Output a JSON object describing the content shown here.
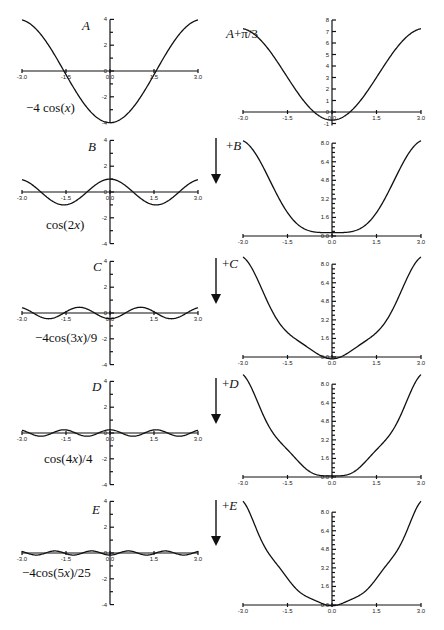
{
  "figure": {
    "colors": {
      "ink": "#111111",
      "background": "#ffffff"
    }
  },
  "chart_data": [
    {
      "type": "line",
      "id": "left-A",
      "panel_label": "A",
      "function_label": "−4 cos(x)",
      "x_ticks": [
        "-3.0",
        "-1.5",
        "0.0",
        "1.5",
        "3.0"
      ],
      "y_ticks": [
        "4",
        "2",
        "0",
        "-2",
        "-4"
      ],
      "xlim": [
        -3,
        3
      ],
      "ylim": [
        -4,
        4
      ],
      "series": [
        {
          "name": "-4cos(x)",
          "expr": "-4*cos(x)",
          "x": [
            -3,
            -2.25,
            -1.5,
            -0.75,
            0,
            0.75,
            1.5,
            2.25,
            3
          ],
          "y": [
            3.96,
            2.51,
            -0.28,
            -2.93,
            -4.0,
            -2.93,
            -0.28,
            2.51,
            3.96
          ]
        }
      ]
    },
    {
      "type": "line",
      "id": "right-A",
      "panel_label": "A+π²/3",
      "panel_label_display": "A+π/3",
      "x_ticks": [
        "-3.0",
        "-1.5",
        "0.0",
        "1.5",
        "3.0"
      ],
      "y_ticks": [
        "8",
        "7",
        "6",
        "5",
        "4",
        "3",
        "2",
        "1",
        "0",
        "-1"
      ],
      "xlim": [
        -3,
        3
      ],
      "ylim": [
        -1,
        8
      ],
      "series": [
        {
          "name": "A + pi^2/3",
          "expr": "pi*pi/3 - 4*cos(x)",
          "x": [
            -3,
            -1.5,
            0,
            1.5,
            3
          ],
          "y": [
            7.25,
            3.01,
            -0.71,
            3.01,
            7.25
          ]
        }
      ]
    },
    {
      "type": "line",
      "id": "left-B",
      "panel_label": "B",
      "function_label": "cos(2x)",
      "x_ticks": [
        "-3.0",
        "-1.5",
        "0.0",
        "1.5",
        "3.0"
      ],
      "y_ticks": [
        "4",
        "2",
        "0",
        "-2",
        "-4"
      ],
      "xlim": [
        -3,
        3
      ],
      "ylim": [
        -4,
        4
      ],
      "series": [
        {
          "name": "cos(2x)",
          "expr": "cos(2*x)",
          "x": [
            -3,
            -1.5,
            0,
            1.5,
            3
          ],
          "y": [
            0.96,
            -0.99,
            1.0,
            -0.99,
            0.96
          ]
        }
      ]
    },
    {
      "type": "line",
      "id": "right-B",
      "panel_label": "+B",
      "x_ticks": [
        "-3.0",
        "-1.5",
        "0.0",
        "1.5",
        "3.0"
      ],
      "y_ticks": [
        "8.0",
        "6.4",
        "4.8",
        "3.2",
        "1.6",
        "0.0"
      ],
      "xlim": [
        -3,
        3
      ],
      "ylim": [
        0,
        8
      ],
      "series": [
        {
          "name": "A+B",
          "expr": "pi*pi/3 - 4*cos(x) + cos(2*x)",
          "x": [
            -3,
            -1.5,
            0,
            1.5,
            3
          ],
          "y": [
            8.21,
            2.02,
            0.29,
            2.02,
            8.21
          ]
        }
      ]
    },
    {
      "type": "line",
      "id": "left-C",
      "panel_label": "C",
      "function_label": "−4cos(3x)/9",
      "x_ticks": [
        "-3.0",
        "-1.5",
        "0.0",
        "1.5",
        "3.0"
      ],
      "y_ticks": [
        "4",
        "2",
        "0",
        "-2",
        "-4"
      ],
      "xlim": [
        -3,
        3
      ],
      "ylim": [
        -4,
        4
      ],
      "series": [
        {
          "name": "-4cos(3x)/9",
          "expr": "-4*cos(3*x)/9",
          "x": [
            -3,
            -1.5,
            0,
            1.5,
            3
          ],
          "y": [
            0.4,
            0.09,
            -0.44,
            0.09,
            0.4
          ]
        }
      ]
    },
    {
      "type": "line",
      "id": "right-C",
      "panel_label": "+C",
      "x_ticks": [
        "-3.0",
        "-1.5",
        "0.0",
        "1.5",
        "3.0"
      ],
      "y_ticks": [
        "8.0",
        "6.4",
        "4.8",
        "3.2",
        "1.6",
        "0.0"
      ],
      "xlim": [
        -3,
        3
      ],
      "ylim": [
        0,
        8
      ],
      "series": [
        {
          "name": "A+B+C",
          "expr": "pi*pi/3 - 4*cos(x) + cos(2*x) - 4*cos(3*x)/9",
          "x": [
            -3,
            -1.5,
            0,
            1.5,
            3
          ],
          "y": [
            8.61,
            2.11,
            -0.15,
            2.11,
            8.61
          ]
        }
      ]
    },
    {
      "type": "line",
      "id": "left-D",
      "panel_label": "D",
      "function_label": "cos(4x)/4",
      "x_ticks": [
        "-3.0",
        "-1.5",
        "0.0",
        "1.5",
        "3.0"
      ],
      "y_ticks": [
        "4",
        "2",
        "0",
        "-2",
        "-4"
      ],
      "xlim": [
        -3,
        3
      ],
      "ylim": [
        -4,
        4
      ],
      "series": [
        {
          "name": "cos(4x)/4",
          "expr": "cos(4*x)/4",
          "x": [
            -3,
            -1.5,
            0,
            1.5,
            3
          ],
          "y": [
            0.21,
            0.24,
            0.25,
            0.24,
            0.21
          ]
        }
      ]
    },
    {
      "type": "line",
      "id": "right-D",
      "panel_label": "+D",
      "x_ticks": [
        "-3.0",
        "-1.5",
        "0.0",
        "1.5",
        "3.0"
      ],
      "y_ticks": [
        "8.0",
        "6.4",
        "4.8",
        "3.2",
        "1.6",
        "0.0"
      ],
      "xlim": [
        -3,
        3
      ],
      "ylim": [
        0,
        8
      ],
      "series": [
        {
          "name": "A+B+C+D",
          "expr": "pi*pi/3 - 4*cos(x) + cos(2*x) - 4*cos(3*x)/9 + cos(4*x)/4",
          "x": [
            -3,
            -1.5,
            0,
            1.5,
            3
          ],
          "y": [
            8.82,
            2.35,
            0.1,
            2.35,
            8.82
          ]
        }
      ]
    },
    {
      "type": "line",
      "id": "left-E",
      "panel_label": "E",
      "function_label": "−4cos(5x)/25",
      "x_ticks": [
        "-3.0",
        "-1.5",
        "0.0",
        "1.5",
        "3.0"
      ],
      "y_ticks": [
        "4",
        "2",
        "0",
        "-2",
        "-4"
      ],
      "xlim": [
        -3,
        3
      ],
      "ylim": [
        -4,
        4
      ],
      "series": [
        {
          "name": "-4cos(5x)/25",
          "expr": "-4*cos(5*x)/25",
          "x": [
            -3,
            -1.5,
            0,
            1.5,
            3
          ],
          "y": [
            0.12,
            -0.06,
            -0.16,
            -0.06,
            0.12
          ]
        }
      ]
    },
    {
      "type": "line",
      "id": "right-E",
      "panel_label": "+E",
      "x_ticks": [
        "-3.0",
        "-1.5",
        "0.0",
        "1.5",
        "3.0"
      ],
      "y_ticks": [
        "8.0",
        "6.4",
        "4.8",
        "3.2",
        "1.6",
        "0.0"
      ],
      "xlim": [
        -3,
        3
      ],
      "ylim": [
        0,
        8
      ],
      "series": [
        {
          "name": "A+B+C+D+E",
          "expr": "pi*pi/3 - 4*cos(x) + cos(2*x) - 4*cos(3*x)/9 + cos(4*x)/4 - 4*cos(5*x)/25",
          "x": [
            -3,
            -1.5,
            0,
            1.5,
            3
          ],
          "y": [
            8.94,
            2.29,
            -0.06,
            2.29,
            8.94
          ]
        }
      ]
    }
  ],
  "layout": {
    "left": {
      "x0": 22,
      "x1": 198,
      "yaxis_x": 110,
      "px_per_unit": 12.9,
      "baselines": [
        71,
        192,
        313,
        433,
        553
      ]
    },
    "right": [
      {
        "x0": 243,
        "x1": 421,
        "yaxis_x": 332,
        "baseline": 112,
        "px_per_unit": 11.5,
        "tick_step": 1,
        "tick_min": -1,
        "tick_max": 8,
        "label_every": 1,
        "minor": false
      },
      {
        "x0": 243,
        "x1": 421,
        "yaxis_x": 332,
        "baseline": 236,
        "px_per_unit": 11.6,
        "tick_step": 0.4,
        "tick_min": 0,
        "tick_max": 8,
        "label_every": 4,
        "minor": true
      },
      {
        "x0": 243,
        "x1": 421,
        "yaxis_x": 332,
        "baseline": 357,
        "px_per_unit": 11.6,
        "tick_step": 0.4,
        "tick_min": 0,
        "tick_max": 8,
        "label_every": 4,
        "minor": true
      },
      {
        "x0": 243,
        "x1": 421,
        "yaxis_x": 332,
        "baseline": 477,
        "px_per_unit": 11.6,
        "tick_step": 0.4,
        "tick_min": 0,
        "tick_max": 8,
        "label_every": 4,
        "minor": true
      },
      {
        "x0": 243,
        "x1": 421,
        "yaxis_x": 332,
        "baseline": 605,
        "px_per_unit": 11.6,
        "tick_step": 0.4,
        "tick_min": 0,
        "tick_max": 8,
        "label_every": 4,
        "minor": true
      }
    ],
    "arrows": [
      {
        "x": 216,
        "y0": 138,
        "y1": 184,
        "label": "+B",
        "label_x": 226,
        "label_y": 150
      },
      {
        "x": 216,
        "y0": 258,
        "y1": 304,
        "label": "+C",
        "label_x": 222,
        "label_y": 268
      },
      {
        "x": 216,
        "y0": 378,
        "y1": 424,
        "label": "+D",
        "label_x": 222,
        "label_y": 388
      },
      {
        "x": 216,
        "y0": 500,
        "y1": 546,
        "label": "+E",
        "label_x": 222,
        "label_y": 510
      }
    ],
    "left_labels": [
      {
        "panel": "A",
        "px": 82,
        "py": 30,
        "fn": "−4 cos(x)",
        "fx": 26,
        "fy": 112
      },
      {
        "panel": "B",
        "px": 88,
        "py": 151,
        "fn": "cos(2x)",
        "fx": 46,
        "fy": 229
      },
      {
        "panel": "C",
        "px": 93,
        "py": 271,
        "fn": "−4cos(3x)/9",
        "fx": 35,
        "fy": 342
      },
      {
        "panel": "D",
        "px": 92,
        "py": 391,
        "fn": "cos(4x)/4",
        "fx": 44,
        "fy": 463
      },
      {
        "panel": "E",
        "px": 92,
        "py": 514,
        "fn": "−4cos(5x)/25",
        "fx": 22,
        "fy": 577
      }
    ],
    "right_title": {
      "text": "A+π/3",
      "x": 226,
      "y": 38
    }
  }
}
